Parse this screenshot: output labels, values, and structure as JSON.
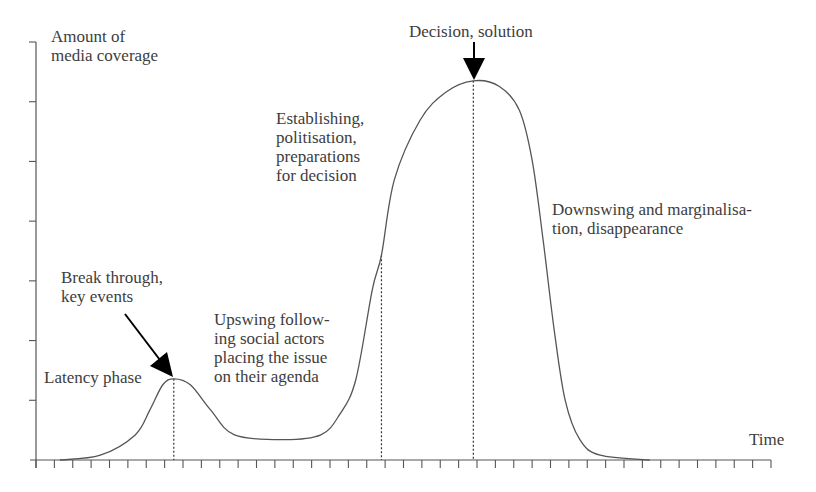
{
  "chart_data": {
    "type": "line",
    "title": "",
    "ylabel": "Amount of\nmedia coverage",
    "xlabel": "Time",
    "xlim": [
      0,
      40
    ],
    "ylim": [
      0,
      7
    ],
    "x_tick_count": 41,
    "y_tick_values": [
      1,
      2,
      3,
      4,
      5,
      6,
      7
    ],
    "grid": false,
    "legend": "none",
    "series": [
      {
        "name": "media coverage",
        "x": [
          1.3,
          3.5,
          5.4,
          6.2,
          6.9,
          7.5,
          8.4,
          9.5,
          10.8,
          13.5,
          15.5,
          16.5,
          17.4,
          18.3,
          18.8,
          19.5,
          20.9,
          22.3,
          23.8,
          25.2,
          26.3,
          27.0,
          27.6,
          28.2,
          28.8,
          29.6,
          30.7,
          33.4
        ],
        "y": [
          0,
          0.08,
          0.42,
          0.84,
          1.26,
          1.36,
          1.26,
          0.84,
          0.42,
          0.34,
          0.42,
          0.75,
          1.34,
          2.85,
          3.43,
          4.69,
          5.69,
          6.16,
          6.35,
          6.26,
          5.86,
          5.02,
          3.68,
          2.18,
          1.0,
          0.34,
          0.08,
          0
        ]
      }
    ],
    "markers": [
      {
        "name": "break-through",
        "x": 7.5
      },
      {
        "name": "establishing",
        "x": 18.8
      },
      {
        "name": "decision",
        "x": 23.8
      }
    ],
    "annotations": [
      {
        "id": "latency",
        "text": "Latency phase"
      },
      {
        "id": "breakthrough",
        "text": "Break through,\nkey events"
      },
      {
        "id": "upswing",
        "text": "Upswing follow-\ning social actors\nplacing the issue\non their agenda"
      },
      {
        "id": "establishing",
        "text": "Establishing,\npolitisation,\npreparations\nfor decision"
      },
      {
        "id": "decision",
        "text": "Decision, solution"
      },
      {
        "id": "downswing",
        "text": "Downswing and marginalisa-\ntion, disappearance"
      }
    ]
  },
  "colors": {
    "line": "#555555",
    "text": "#3d3d3d",
    "arrow": "#000000"
  }
}
